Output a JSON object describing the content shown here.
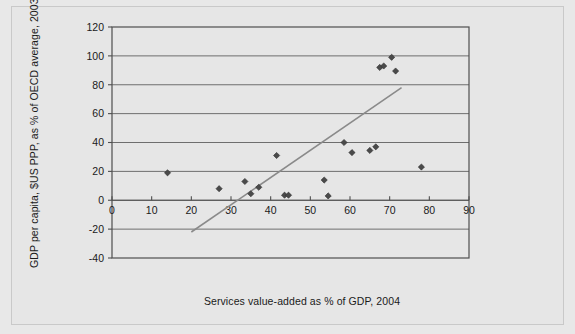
{
  "chart_data": {
    "type": "scatter",
    "title": "",
    "xlabel": "Services value-added as % of GDP, 2004",
    "ylabel": "GDP per capita, $US PPP, as % of OECD average, 2003",
    "xlim": [
      0,
      90
    ],
    "ylim": [
      -40,
      120
    ],
    "xticks": [
      0,
      10,
      20,
      30,
      40,
      50,
      60,
      70,
      80,
      90
    ],
    "yticks": [
      -40,
      -20,
      0,
      20,
      40,
      60,
      80,
      100,
      120
    ],
    "xtick_labels": [
      "0",
      "10",
      "20",
      "30",
      "40",
      "50",
      "60",
      "70",
      "80",
      "90"
    ],
    "ytick_labels": [
      "-40",
      "-20",
      "0",
      "20",
      "40",
      "60",
      "80",
      "100",
      "120"
    ],
    "grid": true,
    "grid_axis": "y",
    "legend": false,
    "legend_position": "none",
    "marker": "diamond",
    "marker_color": "#4a4a4a",
    "points": [
      {
        "x": 14.0,
        "y": 19.0
      },
      {
        "x": 27.0,
        "y": 8.0
      },
      {
        "x": 33.5,
        "y": 13.0
      },
      {
        "x": 35.0,
        "y": 4.5
      },
      {
        "x": 37.0,
        "y": 9.0
      },
      {
        "x": 41.5,
        "y": 31.0
      },
      {
        "x": 43.5,
        "y": 3.5
      },
      {
        "x": 44.5,
        "y": 3.5
      },
      {
        "x": 53.5,
        "y": 14.0
      },
      {
        "x": 54.5,
        "y": 3.0
      },
      {
        "x": 58.5,
        "y": 40.0
      },
      {
        "x": 60.5,
        "y": 33.0
      },
      {
        "x": 65.0,
        "y": 34.5
      },
      {
        "x": 66.5,
        "y": 37.0
      },
      {
        "x": 67.5,
        "y": 92.0
      },
      {
        "x": 68.5,
        "y": 93.0
      },
      {
        "x": 70.5,
        "y": 99.0
      },
      {
        "x": 71.5,
        "y": 89.5
      },
      {
        "x": 78.0,
        "y": 23.0
      }
    ],
    "trendline": {
      "type": "linear",
      "x_start": 20.0,
      "y_start": -22.0,
      "x_end": 73.0,
      "y_end": 78.0,
      "color": "#8a8a8a"
    }
  },
  "axes": {
    "y_title": "GDP per capita, $US PPP, as % of OECD average, 2003",
    "x_title": "Services value-added as % of GDP, 2004"
  }
}
